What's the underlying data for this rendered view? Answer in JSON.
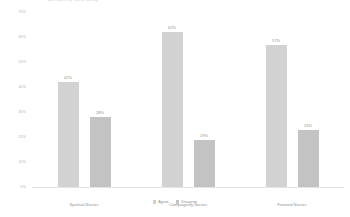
{
  "chart_data": {
    "type": "bar",
    "title": "Attitudes by nurse group",
    "categories": [
      "Spiritual Nurses",
      "Campaigning Nurses",
      "Forward Nurses"
    ],
    "series": [
      {
        "name": "Agree",
        "values": [
          42,
          62,
          57
        ],
        "color": "#d2d2d2"
      },
      {
        "name": "Disagree",
        "values": [
          28,
          19,
          23
        ],
        "color": "#c3c3c3"
      }
    ],
    "value_labels": [
      [
        "42%",
        "28%"
      ],
      [
        "62%",
        "19%"
      ],
      [
        "57%",
        "23%"
      ]
    ],
    "xlabel": "",
    "ylabel": "",
    "ylim": [
      0,
      70
    ],
    "yticks": [
      0,
      10,
      20,
      30,
      40,
      50,
      60,
      70
    ],
    "ytick_labels": [
      "0%",
      "10%",
      "20%",
      "30%",
      "40%",
      "50%",
      "60%",
      "70%"
    ],
    "grid": false,
    "legend_position": "bottom"
  },
  "legend": {
    "items": [
      {
        "label": "Agree"
      },
      {
        "label": "Disagree"
      }
    ]
  }
}
